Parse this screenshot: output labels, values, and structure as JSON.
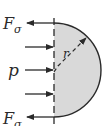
{
  "diagram": {
    "labels": {
      "force_top_main": "F",
      "force_top_sub": "σ",
      "force_bottom_main": "F",
      "force_bottom_sub": "σ",
      "pressure": "p",
      "radius": "r"
    },
    "colors": {
      "fill": "#d9d9d9",
      "stroke": "#2a2a2a",
      "background": "#ffffff"
    },
    "pressure_arrows": 3
  }
}
